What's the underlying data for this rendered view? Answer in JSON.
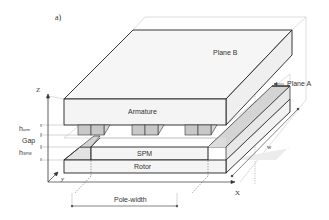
{
  "figure": {
    "label": "a)",
    "colors": {
      "outline": "#222222",
      "face_light": "#f4f4f4",
      "face_mid": "#ececec",
      "tooth_fill": "#c8c8c8",
      "magnet_shadow": "#d6d6d6",
      "guide_lines": "#bbbbbb"
    }
  },
  "planes": {
    "plane_b": "Plane B",
    "plane_a": "Plane A"
  },
  "components": {
    "armature": "Armature",
    "spm": "SPM",
    "rotor": "Rotor"
  },
  "dimensions": {
    "h_arm": {
      "base": "h",
      "sub": "arm"
    },
    "gap": "Gap",
    "h_spm": {
      "base": "h",
      "sub": "SPM"
    },
    "pole_width": "Pole-width",
    "width": "w"
  },
  "axes": {
    "z": "Z",
    "x": "X",
    "y": "y"
  }
}
